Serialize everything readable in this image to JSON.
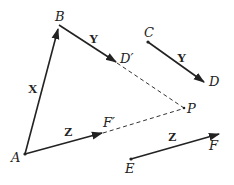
{
  "diagram": {
    "type": "vector-addition",
    "colors": {
      "line": "#222222",
      "background": "#ffffff"
    },
    "points": {
      "A": {
        "label": "A",
        "x": 25,
        "y": 154
      },
      "B": {
        "label": "B",
        "x": 59,
        "y": 25
      },
      "C": {
        "label": "C",
        "x": 148,
        "y": 42
      },
      "D": {
        "label": "D",
        "x": 205,
        "y": 83
      },
      "D_prime": {
        "label": "D′",
        "x": 117,
        "y": 63
      },
      "E": {
        "label": "E",
        "x": 131,
        "y": 159
      },
      "F": {
        "label": "F",
        "x": 220,
        "y": 134
      },
      "F_prime": {
        "label": "F′",
        "x": 103,
        "y": 133
      },
      "P": {
        "label": "P",
        "x": 184,
        "y": 108
      }
    },
    "vectors": {
      "AB": {
        "label": "X",
        "from": "A",
        "to": "B"
      },
      "BD_prime": {
        "label": "Y",
        "from": "B",
        "to": "D′"
      },
      "CD": {
        "label": "Y",
        "from": "C",
        "to": "D"
      },
      "AF_prime": {
        "label": "Z",
        "from": "A",
        "to": "F′"
      },
      "EF": {
        "label": "Z",
        "from": "E",
        "to": "F"
      }
    },
    "dashed_segments": [
      {
        "from": "D′",
        "to": "P"
      },
      {
        "from": "F′",
        "to": "P"
      }
    ]
  }
}
